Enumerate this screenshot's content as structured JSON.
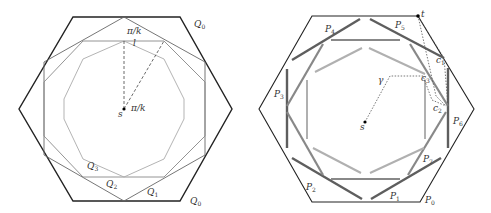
{
  "left_figure": {
    "labels": {
      "q0_top": "Q",
      "q0_top_sub": "0",
      "q0_bottom": "Q",
      "q0_bottom_sub": "0",
      "q1": "Q",
      "q1_sub": "1",
      "q2": "Q",
      "q2_sub": "2",
      "q3": "Q",
      "q3_sub": "3",
      "angle_top": "π/k",
      "angle_center": "π/k",
      "l": "l",
      "s": "s"
    }
  },
  "right_figure": {
    "labels": {
      "p0": "P",
      "p0_sub": "0",
      "p1": "P",
      "p1_sub": "1",
      "p2": "P",
      "p2_sub": "2",
      "p3": "P",
      "p3_sub": "3",
      "p4": "P",
      "p4_sub": "4",
      "p5": "P",
      "p5_sub": "5",
      "p6": "P",
      "p6_sub": "6",
      "p7": "P",
      "p7_sub": "7",
      "t": "t",
      "c1": "c",
      "c1_sub": "1",
      "c2": "c",
      "c2_sub": "2",
      "c3": "c",
      "c3_sub": "3",
      "gamma": "γ",
      "s": "s"
    }
  },
  "colors": {
    "outer": "#222222",
    "q1": "#555555",
    "q2": "#888888",
    "q3": "#b0b0b0",
    "bar_dark": "#5a5a5a",
    "bar_mid": "#8a8a8a",
    "bar_light": "#b5b5b5"
  }
}
